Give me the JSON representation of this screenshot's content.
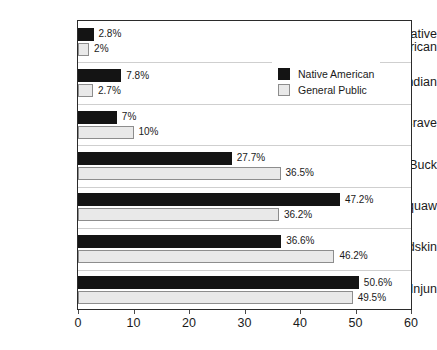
{
  "chart_data": {
    "type": "bar",
    "orientation": "horizontal",
    "title": "",
    "xlabel": "",
    "ylabel": "",
    "xlim": [
      0,
      60
    ],
    "xticks": [
      "0",
      "10",
      "20",
      "30",
      "40",
      "50",
      "60"
    ],
    "grid": true,
    "legend_position": "top-right",
    "categories": [
      "Native American",
      "Indian",
      "Brave",
      "Buck",
      "Squaw",
      "Redskin",
      "Injun"
    ],
    "category_lines": [
      [
        "Native",
        "American"
      ],
      [
        "Indian"
      ],
      [
        "Brave"
      ],
      [
        "Buck"
      ],
      [
        "Squaw"
      ],
      [
        "Redskin"
      ],
      [
        "Injun"
      ]
    ],
    "series": [
      {
        "name": "Native American",
        "color": "#141414",
        "values": [
          2.8,
          7.8,
          7,
          27.7,
          47.2,
          36.6,
          50.6
        ],
        "labels": [
          "2.8%",
          "7.8%",
          "7%",
          "27.7%",
          "47.2%",
          "36.6%",
          "50.6%"
        ]
      },
      {
        "name": "General Public",
        "color": "#e9e9e9",
        "values": [
          2,
          2.7,
          10,
          36.5,
          36.2,
          46.2,
          49.5
        ],
        "labels": [
          "2%",
          "2.7%",
          "10%",
          "36.5%",
          "36.2%",
          "46.2%",
          "49.5%"
        ]
      }
    ]
  },
  "legend": {
    "items": [
      {
        "label": "Native American",
        "swatch": "native"
      },
      {
        "label": "General Public",
        "swatch": "general"
      }
    ]
  }
}
